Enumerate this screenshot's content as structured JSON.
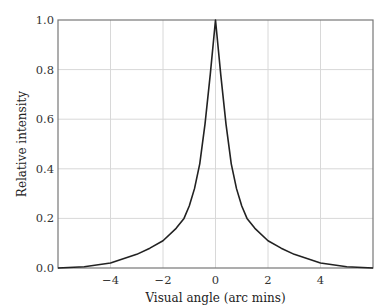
{
  "chart_data": {
    "type": "line",
    "title": "",
    "xlabel": "Visual angle (arc mins)",
    "ylabel": "Relative intensity",
    "xlim": [
      -6,
      6
    ],
    "ylim": [
      0,
      1.0
    ],
    "grid": true,
    "legend": null,
    "x_ticks": [
      -4,
      -2,
      0,
      2,
      4
    ],
    "x_tick_labels": [
      "−4",
      "−2",
      "0",
      "2",
      "4"
    ],
    "y_ticks": [
      0.0,
      0.2,
      0.4,
      0.6,
      0.8,
      1.0
    ],
    "y_tick_labels": [
      "0.0",
      "0.2",
      "0.4",
      "0.6",
      "0.8",
      "1.0"
    ],
    "series": [
      {
        "name": "Point spread function",
        "color": "#222222",
        "x": [
          -6,
          -5,
          -4,
          -3,
          -2.5,
          -2,
          -1.5,
          -1.2,
          -1,
          -0.8,
          -0.6,
          -0.4,
          -0.2,
          0,
          0.2,
          0.4,
          0.6,
          0.8,
          1,
          1.2,
          1.5,
          2,
          2.5,
          3,
          4,
          5,
          6
        ],
        "y": [
          0.0,
          0.005,
          0.02,
          0.055,
          0.08,
          0.11,
          0.16,
          0.2,
          0.25,
          0.32,
          0.42,
          0.58,
          0.78,
          1.0,
          0.78,
          0.58,
          0.42,
          0.32,
          0.25,
          0.2,
          0.16,
          0.11,
          0.08,
          0.055,
          0.02,
          0.005,
          0.0
        ]
      }
    ]
  }
}
